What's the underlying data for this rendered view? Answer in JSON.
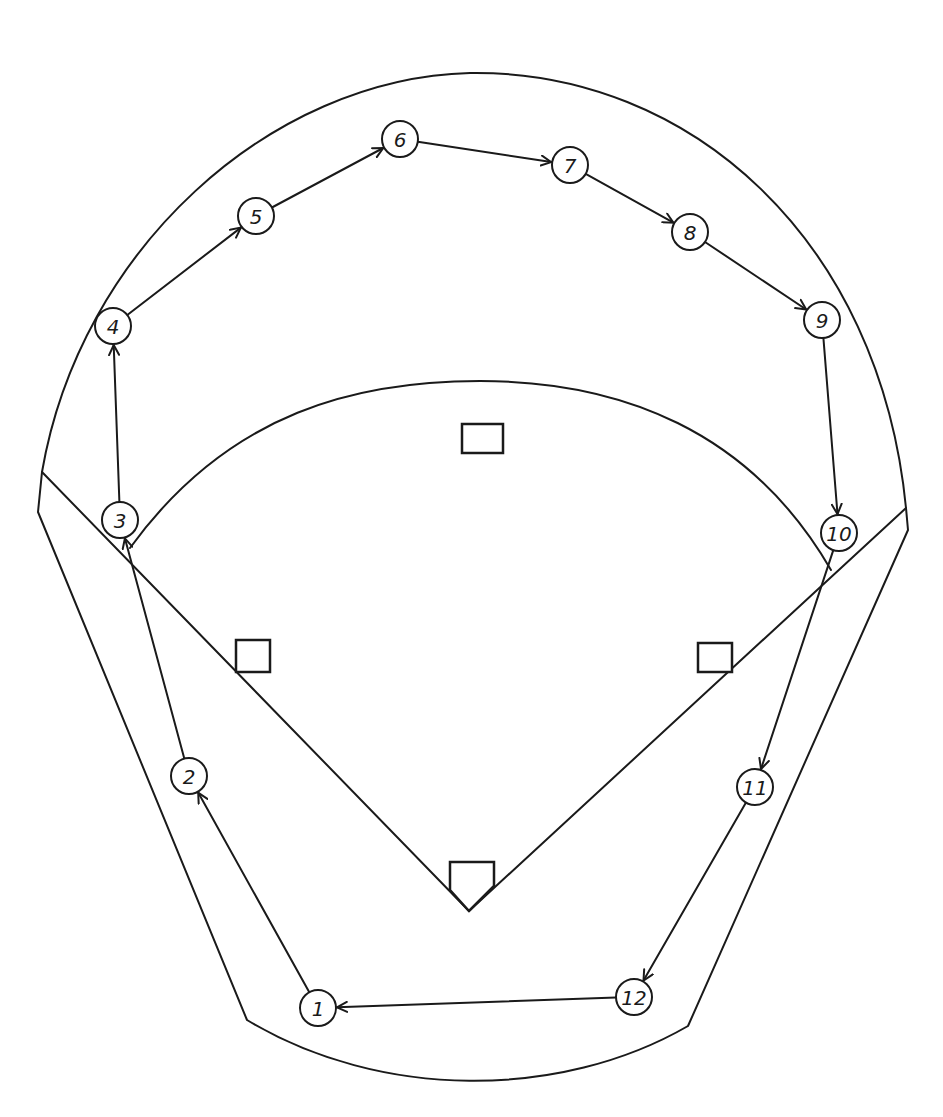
{
  "diagram": {
    "type": "baseball-field-rotation",
    "stroke_color": "#1a1a1a",
    "background": "#ffffff",
    "nodes": [
      {
        "label": "1",
        "x": 318,
        "y": 1008
      },
      {
        "label": "2",
        "x": 189,
        "y": 776
      },
      {
        "label": "3",
        "x": 120,
        "y": 520
      },
      {
        "label": "4",
        "x": 113,
        "y": 326
      },
      {
        "label": "5",
        "x": 256,
        "y": 216
      },
      {
        "label": "6",
        "x": 400,
        "y": 139
      },
      {
        "label": "7",
        "x": 570,
        "y": 165
      },
      {
        "label": "8",
        "x": 690,
        "y": 232
      },
      {
        "label": "9",
        "x": 822,
        "y": 320
      },
      {
        "label": "10",
        "x": 839,
        "y": 533
      },
      {
        "label": "11",
        "x": 755,
        "y": 787
      },
      {
        "label": "12",
        "x": 634,
        "y": 997
      }
    ],
    "edges": [
      {
        "from": "1",
        "to": "2"
      },
      {
        "from": "2",
        "to": "3"
      },
      {
        "from": "3",
        "to": "4"
      },
      {
        "from": "4",
        "to": "5"
      },
      {
        "from": "5",
        "to": "6"
      },
      {
        "from": "6",
        "to": "7"
      },
      {
        "from": "7",
        "to": "8"
      },
      {
        "from": "8",
        "to": "9"
      },
      {
        "from": "9",
        "to": "10"
      },
      {
        "from": "10",
        "to": "11"
      },
      {
        "from": "11",
        "to": "12"
      },
      {
        "from": "12",
        "to": "1"
      }
    ],
    "bases": [
      {
        "name": "first-base",
        "x": 698,
        "y": 643,
        "w": 34,
        "h": 29
      },
      {
        "name": "second-base",
        "x": 462,
        "y": 424,
        "w": 41,
        "h": 29
      },
      {
        "name": "third-base",
        "x": 236,
        "y": 640,
        "w": 34,
        "h": 32
      }
    ]
  }
}
